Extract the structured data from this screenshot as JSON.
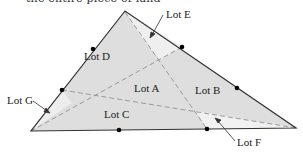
{
  "caption": {
    "text": "the entire piece of land"
  },
  "diagram": {
    "colors": {
      "fill_main": "#dedede",
      "fill_light": "#eeeeee",
      "edge": "#333333",
      "dash": "#9a9a9a",
      "dot": "#000000"
    },
    "vertices": {
      "top": [
        125,
        11
      ],
      "bottom_left": [
        31,
        131
      ],
      "bottom_right": [
        296,
        128
      ]
    },
    "dots": [
      {
        "edge": "left",
        "x": 93,
        "y": 49
      },
      {
        "edge": "left",
        "x": 62,
        "y": 90
      },
      {
        "edge": "right",
        "x": 182,
        "y": 47
      },
      {
        "edge": "right",
        "x": 237,
        "y": 88
      },
      {
        "edge": "bottom",
        "x": 119,
        "y": 130
      },
      {
        "edge": "bottom",
        "x": 207,
        "y": 129
      }
    ],
    "lots": [
      {
        "id": "A",
        "label": "Lot A",
        "x": 134,
        "y": 92
      },
      {
        "id": "B",
        "label": "Lot B",
        "x": 195,
        "y": 94
      },
      {
        "id": "C",
        "label": "Lot C",
        "x": 104,
        "y": 118
      },
      {
        "id": "D",
        "label": "Lot D",
        "x": 84,
        "y": 60
      },
      {
        "id": "E",
        "label": "Lot E",
        "x": 166,
        "y": 18
      },
      {
        "id": "F",
        "label": "Lot F",
        "x": 237,
        "y": 146
      },
      {
        "id": "G",
        "label": "Lot G",
        "x": 7,
        "y": 104
      }
    ]
  }
}
